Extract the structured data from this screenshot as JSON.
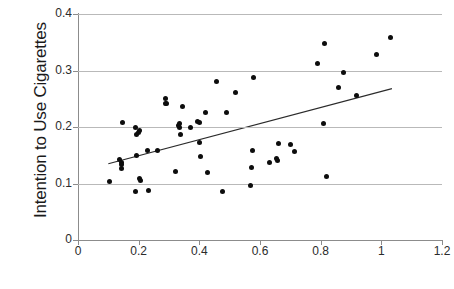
{
  "chart_data": {
    "type": "scatter",
    "title": "",
    "xlabel": "",
    "ylabel": "Intention to Use Cigarettes",
    "xlim": [
      0,
      1.2
    ],
    "ylim": [
      0,
      0.4
    ],
    "xticks": [
      "0",
      "0.2",
      "0.4",
      "0.6",
      "0.8",
      "1",
      "1.2"
    ],
    "xtick_values": [
      0,
      0.2,
      0.4,
      0.6,
      0.8,
      1,
      1.2
    ],
    "yticks": [
      "0",
      "0.1",
      "0.2",
      "0.3",
      "0.4"
    ],
    "ytick_values": [
      0,
      0.1,
      0.2,
      0.3,
      0.4
    ],
    "grid": "horizontal",
    "legend": "none",
    "marker_color": "#0d0d0d",
    "gridline_color": "#b9b9b9",
    "axis_color": "#8c8c8c",
    "trendline": {
      "type": "linear",
      "x_start": 0.1,
      "y_start": 0.135,
      "x_end": 1.035,
      "y_end": 0.268,
      "color": "#2b2b2b"
    },
    "points": [
      [
        0.105,
        0.104
      ],
      [
        0.138,
        0.143
      ],
      [
        0.142,
        0.137
      ],
      [
        0.143,
        0.133
      ],
      [
        0.145,
        0.127
      ],
      [
        0.148,
        0.208
      ],
      [
        0.188,
        0.086
      ],
      [
        0.19,
        0.2
      ],
      [
        0.192,
        0.187
      ],
      [
        0.194,
        0.149
      ],
      [
        0.2,
        0.191
      ],
      [
        0.202,
        0.193
      ],
      [
        0.203,
        0.109
      ],
      [
        0.205,
        0.105
      ],
      [
        0.23,
        0.159
      ],
      [
        0.232,
        0.087
      ],
      [
        0.262,
        0.158
      ],
      [
        0.288,
        0.25
      ],
      [
        0.29,
        0.242
      ],
      [
        0.293,
        0.242
      ],
      [
        0.322,
        0.122
      ],
      [
        0.33,
        0.202
      ],
      [
        0.334,
        0.199
      ],
      [
        0.336,
        0.206
      ],
      [
        0.338,
        0.187
      ],
      [
        0.345,
        0.237
      ],
      [
        0.372,
        0.2
      ],
      [
        0.395,
        0.21
      ],
      [
        0.4,
        0.208
      ],
      [
        0.402,
        0.173
      ],
      [
        0.405,
        0.147
      ],
      [
        0.42,
        0.226
      ],
      [
        0.428,
        0.12
      ],
      [
        0.458,
        0.28
      ],
      [
        0.478,
        0.086
      ],
      [
        0.49,
        0.225
      ],
      [
        0.518,
        0.261
      ],
      [
        0.568,
        0.096
      ],
      [
        0.572,
        0.128
      ],
      [
        0.575,
        0.159
      ],
      [
        0.58,
        0.288
      ],
      [
        0.63,
        0.137
      ],
      [
        0.655,
        0.145
      ],
      [
        0.658,
        0.141
      ],
      [
        0.66,
        0.17
      ],
      [
        0.7,
        0.169
      ],
      [
        0.715,
        0.156
      ],
      [
        0.79,
        0.312
      ],
      [
        0.808,
        0.207
      ],
      [
        0.812,
        0.348
      ],
      [
        0.82,
        0.113
      ],
      [
        0.858,
        0.27
      ],
      [
        0.875,
        0.296
      ],
      [
        0.918,
        0.256
      ],
      [
        0.985,
        0.328
      ],
      [
        1.03,
        0.358
      ]
    ]
  }
}
